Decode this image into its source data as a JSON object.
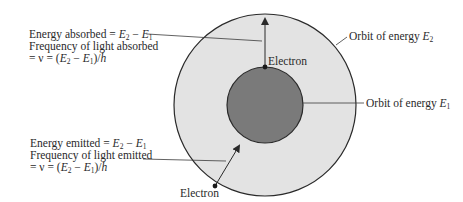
{
  "diagram": {
    "colors": {
      "outer_orbit_fill": "#e3e3e3",
      "inner_orbit_fill": "#7a7a7a",
      "stroke": "#2a2a2a",
      "text": "#2a2a2a"
    },
    "absorbed": {
      "line1_prefix": "Energy absorbed = ",
      "line2": "Frequency of light absorbed",
      "line3_prefix": "= ν = (",
      "line3_suffix": ")/",
      "h": "h"
    },
    "emitted": {
      "line1_prefix": "Energy emitted = ",
      "line2": "Frequency of light emitted",
      "line3_prefix": "= ν = (",
      "line3_suffix": ")/",
      "h": "h"
    },
    "symbols": {
      "E": "E",
      "sub2": "2",
      "sub1": "1",
      "minus": " − "
    },
    "labels": {
      "electron_top": "Electron",
      "electron_bottom": "Electron",
      "orbit_e2_prefix": "Orbit of energy ",
      "orbit_e1_prefix": "Orbit of energy "
    }
  }
}
